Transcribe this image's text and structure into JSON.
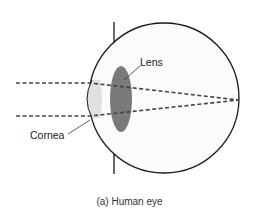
{
  "diagram": {
    "labels": {
      "lens": "Lens",
      "cornea": "Cornea"
    },
    "caption": "(a) Human eye",
    "colors": {
      "outline": "#1a1a1a",
      "lens_fill": "#7a7a7a",
      "cornea_fill": "#e0e0e0",
      "eyeball_fill": "#fbfbfb",
      "ray": "#444444"
    }
  }
}
